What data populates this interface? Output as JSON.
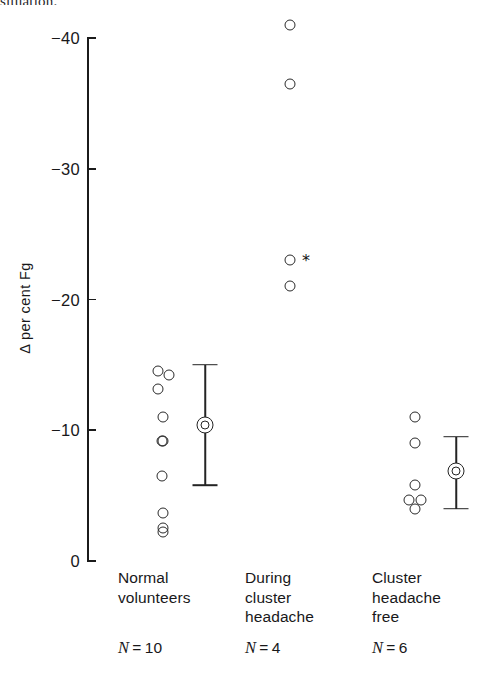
{
  "page_bleed_text": "situation.",
  "chart_data": {
    "type": "scatter",
    "title": "",
    "xlabel": "",
    "ylabel": "Δ per cent Fg",
    "ylim": [
      0,
      -40
    ],
    "y_inverted": true,
    "grid": false,
    "legend": "none",
    "y_ticks": [
      {
        "label": "−40",
        "value": -40
      },
      {
        "label": "−30",
        "value": -30
      },
      {
        "label": "−20",
        "value": -20
      },
      {
        "label": "−10",
        "value": -10
      },
      {
        "label": "0",
        "value": 0
      }
    ],
    "annotations": [
      {
        "text": "*",
        "near_value": -23,
        "group": "During cluster headache"
      }
    ],
    "categories": [
      "Normal volunteers",
      "During cluster headache",
      "Cluster headache free"
    ],
    "groups": [
      {
        "name": "Normal volunteers",
        "label_lines": [
          "Normal",
          "volunteers"
        ],
        "n_label": "N = 10",
        "n": 10,
        "values": [
          -14.5,
          -14.4,
          -13.9,
          -11.0,
          -10.0,
          -9.2,
          -6.5,
          -3.7,
          -3.0,
          -2.5
        ],
        "mean": -10.4,
        "error_low": -5.8,
        "error_high": -15.0,
        "has_error_bar": true
      },
      {
        "name": "During cluster headache",
        "label_lines": [
          "During",
          "cluster",
          "headache"
        ],
        "n_label": "N = 4",
        "n": 4,
        "values": [
          -41.0,
          -36.5,
          -23.0,
          -21.0
        ],
        "mean": null,
        "error_low": null,
        "error_high": null,
        "has_error_bar": false
      },
      {
        "name": "Cluster headache free",
        "label_lines": [
          "Cluster",
          "headache",
          "free"
        ],
        "n_label": "N = 6",
        "n": 6,
        "values": [
          -11.0,
          -9.0,
          -5.8,
          -5.0,
          -5.0,
          -4.0
        ],
        "mean": -6.9,
        "error_low": -4.0,
        "error_high": -9.5,
        "has_error_bar": true
      }
    ]
  }
}
